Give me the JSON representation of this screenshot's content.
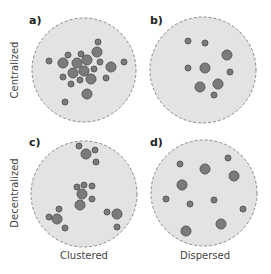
{
  "colors": {
    "background": "#ffffff",
    "region_fill": "#e3e3e3",
    "region_border": "#8a8a8a",
    "dot_fill": "#7b7b7b",
    "dot_border": "#5a5a5a",
    "text": "#444444"
  },
  "row_labels": [
    {
      "text": "Centralized",
      "x": 14,
      "y": 70
    },
    {
      "text": "Decentralized",
      "x": 14,
      "y": 193
    }
  ],
  "column_labels": [
    {
      "text": "Clustered",
      "x": 84,
      "y": 259
    },
    {
      "text": "Dispersed",
      "x": 205,
      "y": 259
    }
  ],
  "panels": [
    {
      "label": "a)",
      "label_x": 29,
      "label_y": 24,
      "cx": 84,
      "cy": 70,
      "r": 52,
      "dots": [
        [
          98,
          42,
          3
        ],
        [
          97,
          52,
          5
        ],
        [
          68,
          55,
          3
        ],
        [
          81,
          54,
          3
        ],
        [
          49,
          61,
          3
        ],
        [
          63,
          63,
          5
        ],
        [
          77,
          63,
          5
        ],
        [
          87,
          60,
          5
        ],
        [
          100,
          62,
          3
        ],
        [
          111,
          67,
          5
        ],
        [
          124,
          62,
          3
        ],
        [
          63,
          77,
          3
        ],
        [
          73,
          73,
          5
        ],
        [
          84,
          71,
          5
        ],
        [
          94,
          69,
          3
        ],
        [
          80,
          80,
          3
        ],
        [
          91,
          79,
          5
        ],
        [
          106,
          78,
          3
        ],
        [
          71,
          84,
          3
        ],
        [
          87,
          94,
          5
        ],
        [
          65,
          102,
          3
        ]
      ]
    },
    {
      "label": "b)",
      "label_x": 150,
      "label_y": 24,
      "cx": 203,
      "cy": 70,
      "r": 53,
      "dots": [
        [
          188,
          41,
          3
        ],
        [
          205,
          43,
          3
        ],
        [
          227,
          55,
          5
        ],
        [
          188,
          68,
          3
        ],
        [
          205,
          68,
          5
        ],
        [
          230,
          72,
          3
        ],
        [
          200,
          87,
          5
        ],
        [
          218,
          84,
          5
        ],
        [
          214,
          95,
          3
        ]
      ]
    },
    {
      "label": "c)",
      "label_x": 29,
      "label_y": 146,
      "cx": 84,
      "cy": 194,
      "r": 53,
      "dots": [
        [
          79,
          146,
          3
        ],
        [
          86,
          154,
          5
        ],
        [
          95,
          150,
          3
        ],
        [
          96,
          162,
          3
        ],
        [
          77,
          187,
          3
        ],
        [
          84,
          185,
          3
        ],
        [
          92,
          186,
          3
        ],
        [
          82,
          194,
          5
        ],
        [
          92,
          199,
          3
        ],
        [
          80,
          205,
          5
        ],
        [
          59,
          209,
          3
        ],
        [
          49,
          217,
          3
        ],
        [
          57,
          219,
          5
        ],
        [
          65,
          228,
          3
        ],
        [
          107,
          212,
          3
        ],
        [
          117,
          214,
          5
        ],
        [
          117,
          227,
          3
        ]
      ]
    },
    {
      "label": "d)",
      "label_x": 150,
      "label_y": 146,
      "cx": 204,
      "cy": 193,
      "r": 53,
      "dots": [
        [
          180,
          164,
          3
        ],
        [
          205,
          169,
          5
        ],
        [
          228,
          158,
          3
        ],
        [
          234,
          176,
          5
        ],
        [
          182,
          185,
          5
        ],
        [
          166,
          199,
          3
        ],
        [
          190,
          204,
          3
        ],
        [
          214,
          200,
          3
        ],
        [
          243,
          209,
          3
        ],
        [
          221,
          224,
          5
        ],
        [
          186,
          231,
          5
        ]
      ]
    }
  ]
}
